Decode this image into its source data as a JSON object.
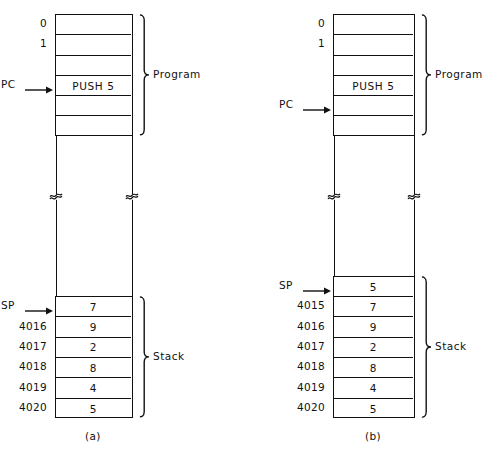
{
  "figure": {
    "panels": [
      {
        "id": "a",
        "caption": "(a)",
        "program": {
          "group_label": "Program",
          "rows": [
            {
              "addr": "0",
              "value": ""
            },
            {
              "addr": "1",
              "value": ""
            },
            {
              "addr": "",
              "value": ""
            },
            {
              "addr": "",
              "value": "PUSH 5",
              "pointer": "PC"
            },
            {
              "addr": "",
              "value": ""
            },
            {
              "addr": "",
              "value": ""
            }
          ]
        },
        "stack": {
          "group_label": "Stack",
          "rows": [
            {
              "addr": "",
              "value": "7",
              "pointer": "SP"
            },
            {
              "addr": "4016",
              "value": "9"
            },
            {
              "addr": "4017",
              "value": "2"
            },
            {
              "addr": "4018",
              "value": "8"
            },
            {
              "addr": "4019",
              "value": "4"
            },
            {
              "addr": "4020",
              "value": "5"
            }
          ]
        }
      },
      {
        "id": "b",
        "caption": "(b)",
        "program": {
          "group_label": "Program",
          "rows": [
            {
              "addr": "0",
              "value": ""
            },
            {
              "addr": "1",
              "value": ""
            },
            {
              "addr": "",
              "value": ""
            },
            {
              "addr": "",
              "value": "PUSH 5"
            },
            {
              "addr": "",
              "value": "",
              "pointer": "PC"
            },
            {
              "addr": "",
              "value": ""
            }
          ]
        },
        "stack": {
          "group_label": "Stack",
          "rows": [
            {
              "addr": "",
              "value": "5",
              "pointer": "SP"
            },
            {
              "addr": "4015",
              "value": "7"
            },
            {
              "addr": "4016",
              "value": "9"
            },
            {
              "addr": "4017",
              "value": "2"
            },
            {
              "addr": "4018",
              "value": "8"
            },
            {
              "addr": "4019",
              "value": "4"
            },
            {
              "addr": "4020",
              "value": "5"
            }
          ]
        }
      }
    ]
  }
}
